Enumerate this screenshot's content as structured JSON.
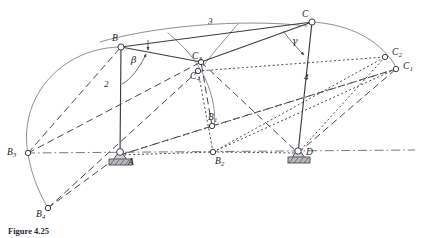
{
  "figure": {
    "caption": "Figure 4.25"
  },
  "labels": {
    "A": {
      "text": "A",
      "sub": "",
      "x": 128,
      "y": 158
    },
    "B": {
      "text": "B",
      "sub": "",
      "x": 112,
      "y": 34
    },
    "C": {
      "text": "C",
      "sub": "",
      "x": 302,
      "y": 10
    },
    "D": {
      "text": "D",
      "sub": "",
      "x": 306,
      "y": 148
    },
    "B1": {
      "text": "B",
      "sub": "1",
      "x": 208,
      "y": 113
    },
    "B2": {
      "text": "B",
      "sub": "2",
      "x": 215,
      "y": 157
    },
    "B3": {
      "text": "B",
      "sub": "3",
      "x": 7,
      "y": 148
    },
    "B4": {
      "text": "B",
      "sub": "4",
      "x": 36,
      "y": 210
    },
    "C1": {
      "text": "C",
      "sub": "1",
      "x": 403,
      "y": 62
    },
    "C2": {
      "text": "C",
      "sub": "2",
      "x": 392,
      "y": 48
    },
    "C3": {
      "text": "C",
      "sub": "3",
      "x": 192,
      "y": 52
    },
    "C4": {
      "text": "C",
      "sub": "4",
      "x": 190,
      "y": 72
    }
  },
  "link_numbers": {
    "link2": {
      "text": "2",
      "x": 104,
      "y": 80
    },
    "link3": {
      "text": "3",
      "x": 208,
      "y": 17
    },
    "link4": {
      "text": "4",
      "x": 304,
      "y": 73
    }
  },
  "angles": {
    "beta": {
      "text": "β",
      "x": 131,
      "y": 55
    },
    "gamma": {
      "text": "γ",
      "x": 292,
      "y": 36
    }
  },
  "geometry": {
    "pivot_A": {
      "x": 120,
      "y": 155
    },
    "pivot_D": {
      "x": 298,
      "y": 153
    },
    "point_B": {
      "x": 121,
      "y": 47
    },
    "point_C": {
      "x": 312,
      "y": 22
    },
    "point_B1": {
      "x": 212,
      "y": 126
    },
    "point_B2": {
      "x": 213,
      "y": 152
    },
    "point_B3": {
      "x": 28,
      "y": 153
    },
    "point_B4": {
      "x": 48,
      "y": 208
    },
    "point_C1": {
      "x": 396,
      "y": 69
    },
    "point_C2": {
      "x": 385,
      "y": 57
    },
    "point_C3": {
      "x": 201,
      "y": 62
    },
    "point_C4": {
      "x": 198,
      "y": 71
    }
  },
  "colors": {
    "line": "#3c3c42",
    "arc": "#6a6a72",
    "ground": "#b9b9bd",
    "background": "#ffffff"
  }
}
